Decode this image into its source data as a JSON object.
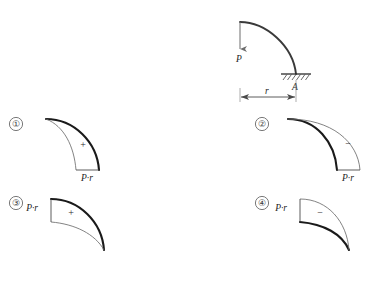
{
  "figure": {
    "background_color": "#ffffff",
    "ink_color": "#1c1c1c",
    "thick_stroke_color": "#1a1a1a",
    "thin_stroke_color": "#6d6d6d"
  },
  "main_diagram": {
    "name": "quarter-circle-cantilever",
    "load_label": "P",
    "support_label": "A",
    "radius_label": "r",
    "support_type": "fixed-hatched",
    "load_direction": "down",
    "arc_description": "quarter circle from free end at upper-left to fixed end at lower-right"
  },
  "options": [
    {
      "number": "①",
      "sign": "+",
      "moment_label": "P·r",
      "label_position": "bottom",
      "baseline_orientation": "vertical-at-bottom",
      "thick_arc_side": "outer",
      "name": "option-1"
    },
    {
      "number": "②",
      "sign": "−",
      "moment_label": "P·r",
      "label_position": "bottom",
      "baseline_orientation": "vertical-at-bottom",
      "thick_arc_side": "inner",
      "name": "option-2"
    },
    {
      "number": "③",
      "sign": "+",
      "moment_label": "P·r",
      "label_position": "top-left",
      "baseline_orientation": "vertical-at-top-left",
      "thick_arc_side": "outer",
      "name": "option-3"
    },
    {
      "number": "④",
      "sign": "−",
      "moment_label": "P·r",
      "label_position": "top-left",
      "baseline_orientation": "vertical-at-top-left",
      "thick_arc_side": "inner",
      "name": "option-4"
    }
  ]
}
